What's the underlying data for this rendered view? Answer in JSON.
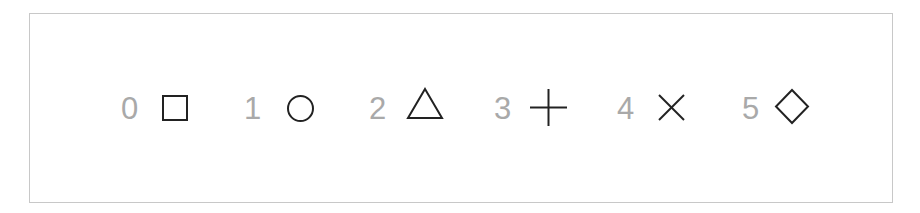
{
  "figure": {
    "items": [
      {
        "index": "0",
        "symbol": "square"
      },
      {
        "index": "1",
        "symbol": "circle"
      },
      {
        "index": "2",
        "symbol": "triangle"
      },
      {
        "index": "3",
        "symbol": "plus"
      },
      {
        "index": "4",
        "symbol": "cross"
      },
      {
        "index": "5",
        "symbol": "diamond"
      }
    ]
  },
  "colors": {
    "digit": "#a9a9a9",
    "symbol": "#222222",
    "frame": "#c8c8c8"
  }
}
